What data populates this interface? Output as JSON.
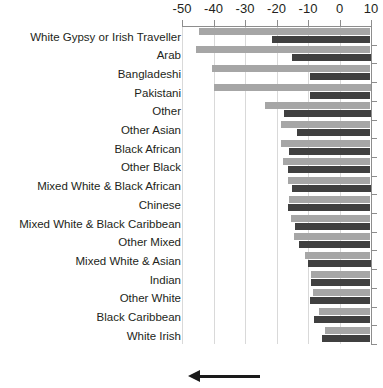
{
  "chart_data": {
    "type": "bar",
    "title": "",
    "xlabel": "",
    "ylabel": "",
    "orientation": "horizontal",
    "xlim": [
      -50,
      10
    ],
    "xticks": [
      -50,
      -40,
      -30,
      -20,
      -10,
      0,
      10
    ],
    "xtick_labels": [
      "-50",
      "-40",
      "-30",
      "-20",
      "-10",
      "0",
      "10"
    ],
    "grid": true,
    "grid_axis": "x",
    "legend": "none",
    "categories": [
      "White Gypsy or Irish Traveller",
      "Arab",
      "Bangladeshi",
      "Pakistani",
      "Other",
      "Other Asian",
      "Black African",
      "Other Black",
      "Mixed White & Black African",
      "Chinese",
      "Mixed White & Black Caribbean",
      "Other Mixed",
      "Mixed White & Asian",
      "Indian",
      "Other White",
      "Black Caribbean",
      "White Irish"
    ],
    "series": [
      {
        "name": "series-light",
        "color": "#a6a6a6",
        "values": [
          -44.5,
          -45.5,
          -40.5,
          -40.0,
          -23.5,
          -18.5,
          -18.5,
          -18.0,
          -16.5,
          -16.0,
          -15.5,
          -14.5,
          -11.0,
          -9.0,
          -8.5,
          -6.5,
          -4.5
        ]
      },
      {
        "name": "series-dark",
        "color": "#404040",
        "values": [
          -21.5,
          -15.0,
          -9.5,
          -9.5,
          -17.5,
          -13.5,
          -16.0,
          -16.5,
          -15.0,
          -16.5,
          -14.0,
          -13.0,
          -10.0,
          -9.0,
          -9.5,
          -8.0,
          -5.5
        ]
      }
    ],
    "annotations": [
      {
        "type": "arrow",
        "direction": "left",
        "label": ""
      }
    ]
  },
  "colors": {
    "light_bar": "#a6a6a6",
    "dark_bar": "#404040",
    "axis": "#8d8d8d",
    "gridline": "#d9d9d9",
    "text": "#231f20",
    "arrow": "#1a1a1a"
  }
}
